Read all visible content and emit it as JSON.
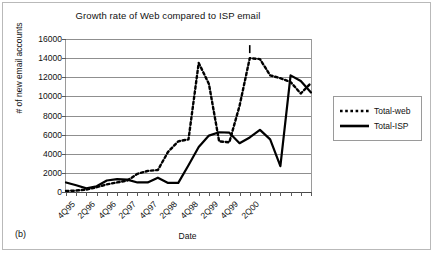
{
  "figure": {
    "caption": "(b)"
  },
  "chart_data": {
    "type": "line",
    "title": "Growth rate of Web compared to ISP email",
    "xlabel": "Date",
    "ylabel": "# of new email accounts",
    "ylim": [
      0,
      16000
    ],
    "ytick_labels": [
      "0",
      "2000",
      "4000",
      "6000",
      "8000",
      "10000",
      "12000",
      "14000",
      "16000"
    ],
    "ytick_values": [
      0,
      2000,
      4000,
      6000,
      8000,
      10000,
      12000,
      14000,
      16000
    ],
    "grid": true,
    "legend_position": "right",
    "x": [
      "4Q95",
      "1Q96",
      "2Q96",
      "3Q96",
      "4Q96",
      "1Q97",
      "2Q97",
      "3Q97",
      "4Q97",
      "1Q98",
      "2Q98",
      "3Q98",
      "4Q98",
      "1Q99",
      "2Q99",
      "3Q99",
      "4Q99",
      "1Q00",
      "2Q00",
      "3Q00",
      "4Q00",
      "1Q01"
    ],
    "xtick_labels": [
      "4Q95",
      "2Q96",
      "4Q96",
      "2Q97",
      "4Q97",
      "2Q98",
      "4Q98",
      "2Q99",
      "4Q99",
      "2Q00"
    ],
    "xtick_indices": [
      0,
      2,
      4,
      6,
      8,
      10,
      12,
      14,
      16,
      18
    ],
    "series": [
      {
        "name": "Total-web",
        "style": "dotted",
        "color": "#000000",
        "values": [
          100,
          150,
          250,
          500,
          800,
          1000,
          1200,
          1900,
          2200,
          2300,
          4200,
          5300,
          5500,
          13500,
          11300,
          5300,
          5200,
          9000,
          14000,
          13900,
          12200,
          11900
        ]
      },
      {
        "name": "Total-ISP",
        "style": "solid",
        "color": "#000000",
        "values": [
          1000,
          700,
          380,
          600,
          1200,
          1350,
          1300,
          1000,
          1000,
          1500,
          950,
          950,
          2800,
          4700,
          5900,
          6250,
          6200,
          5100,
          5700,
          6500,
          5500,
          2700
        ]
      }
    ],
    "series_tail": {
      "Total-web": [
        11900,
        11500,
        10300,
        11400
      ],
      "Total-ISP": [
        13400,
        12200,
        11600,
        10400
      ]
    },
    "annotation_marker": "peak-tick"
  },
  "legend": {
    "items": [
      {
        "label": "Total-web",
        "style": "dotted"
      },
      {
        "label": "Total-ISP",
        "style": "solid"
      }
    ]
  }
}
